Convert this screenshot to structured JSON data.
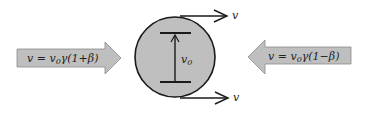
{
  "diagram": {
    "left_arrow": {
      "label_prefix": "v = v",
      "label_sub": "0",
      "label_suffix": "γ(1+β)",
      "direction": "right"
    },
    "right_arrow": {
      "label_prefix": "v = v",
      "label_sub": "0",
      "label_suffix": "γ(1−β)",
      "direction": "left"
    },
    "circle": {
      "inner_label": "v",
      "inner_label_sub": "0"
    },
    "top_velocity_label": "v",
    "bottom_velocity_label": "v",
    "colors": {
      "fill": "#bfbfbf",
      "stroke": "#1a1a1a",
      "background": "#ffffff"
    }
  }
}
